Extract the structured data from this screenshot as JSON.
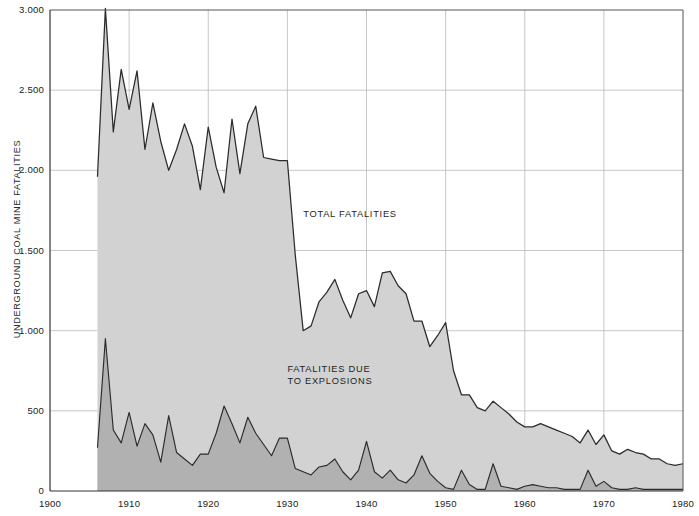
{
  "chart_data": {
    "type": "area",
    "title": "",
    "xlabel": "",
    "ylabel": "UNDERGROUND COAL MINE FATALITIES",
    "xlim": [
      1900,
      1980
    ],
    "ylim": [
      0,
      3000
    ],
    "xticks": [
      1900,
      1910,
      1920,
      1930,
      1940,
      1950,
      1960,
      1970,
      1980
    ],
    "xticklabels": [
      "1900",
      "1910",
      "1920",
      "1930",
      "1940",
      "1950",
      "1960",
      "1970",
      "1980"
    ],
    "yticks": [
      0,
      500,
      1000,
      1500,
      2000,
      2500,
      3000
    ],
    "yticklabels": [
      "0",
      "500",
      "1.000",
      "1.500",
      "2.000",
      "2.500",
      "3.000"
    ],
    "grid": true,
    "legend_position": "inline-annotations",
    "annotations": [
      {
        "text": "TOTAL FATALITIES",
        "x": 1932,
        "y": 1760
      },
      {
        "text": "FATALITIES DUE\nTO EXPLOSIONS",
        "x": 1930,
        "y": 790
      }
    ],
    "stacked": false,
    "x": [
      1906,
      1907,
      1908,
      1909,
      1910,
      1911,
      1912,
      1913,
      1914,
      1915,
      1916,
      1917,
      1918,
      1919,
      1920,
      1921,
      1922,
      1923,
      1924,
      1925,
      1926,
      1927,
      1928,
      1929,
      1930,
      1931,
      1932,
      1933,
      1934,
      1935,
      1936,
      1937,
      1938,
      1939,
      1940,
      1941,
      1942,
      1943,
      1944,
      1945,
      1946,
      1947,
      1948,
      1949,
      1950,
      1951,
      1952,
      1953,
      1954,
      1955,
      1956,
      1957,
      1958,
      1959,
      1960,
      1961,
      1962,
      1963,
      1964,
      1965,
      1966,
      1967,
      1968,
      1969,
      1970,
      1971,
      1972,
      1973,
      1974,
      1975,
      1976,
      1977,
      1978,
      1979,
      1980
    ],
    "series": [
      {
        "name": "TOTAL FATALITIES",
        "color": "#d2d2d2",
        "line_color": "#2b2b2b",
        "values": [
          1960,
          3010,
          2240,
          2630,
          2380,
          2620,
          2130,
          2420,
          2180,
          2000,
          2130,
          2290,
          2150,
          1880,
          2270,
          2020,
          1860,
          2320,
          1980,
          2290,
          2400,
          2080,
          2070,
          2060,
          2060,
          1470,
          1000,
          1030,
          1180,
          1240,
          1320,
          1190,
          1080,
          1230,
          1250,
          1150,
          1360,
          1370,
          1280,
          1230,
          1060,
          1060,
          900,
          970,
          1050,
          750,
          600,
          600,
          520,
          500,
          560,
          520,
          480,
          430,
          400,
          400,
          420,
          400,
          380,
          360,
          340,
          300,
          380,
          290,
          350,
          250,
          230,
          260,
          240,
          230,
          200,
          200,
          170,
          160,
          170
        ]
      },
      {
        "name": "FATALITIES DUE TO EXPLOSIONS",
        "color": "#b1b1b1",
        "line_color": "#2b2b2b",
        "values": [
          270,
          950,
          380,
          300,
          490,
          280,
          420,
          350,
          180,
          470,
          240,
          200,
          160,
          230,
          230,
          360,
          530,
          420,
          300,
          460,
          360,
          290,
          220,
          330,
          330,
          140,
          120,
          100,
          150,
          160,
          200,
          120,
          70,
          130,
          310,
          120,
          80,
          130,
          70,
          50,
          100,
          220,
          110,
          60,
          20,
          10,
          130,
          40,
          10,
          10,
          170,
          30,
          20,
          10,
          30,
          40,
          30,
          20,
          20,
          10,
          10,
          10,
          130,
          30,
          60,
          20,
          10,
          10,
          20,
          10,
          10,
          10,
          10,
          10,
          10
        ]
      }
    ]
  }
}
